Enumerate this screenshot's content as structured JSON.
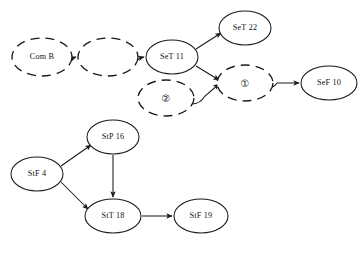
{
  "diagram": {
    "type": "directed-graph",
    "background_color": "#ffffff",
    "stroke_color": "#1a1a1a",
    "node_shape": "ellipse",
    "line_styles": {
      "solid": "solid",
      "dashed": "dashed"
    },
    "caption": "",
    "nodes": [
      {
        "id": "com-b",
        "label": "Com B",
        "style": "dashed",
        "cx": 42,
        "cy": 57,
        "rx": 30,
        "ry": 19,
        "label_kind": "text"
      },
      {
        "id": "blank-1",
        "label": "",
        "style": "dashed",
        "cx": 108,
        "cy": 57,
        "rx": 30,
        "ry": 19,
        "label_kind": "text"
      },
      {
        "id": "set-11",
        "label": "SeT 11",
        "style": "solid",
        "cx": 172,
        "cy": 57,
        "rx": 26,
        "ry": 17,
        "label_kind": "text"
      },
      {
        "id": "set-22",
        "label": "SeT 22",
        "style": "solid",
        "cx": 245,
        "cy": 28,
        "rx": 26,
        "ry": 17,
        "label_kind": "text"
      },
      {
        "id": "circle-1",
        "label": "①",
        "style": "dashed",
        "cx": 245,
        "cy": 83,
        "rx": 28,
        "ry": 18,
        "label_kind": "circled-number"
      },
      {
        "id": "circle-2",
        "label": "②",
        "style": "dashed",
        "cx": 166,
        "cy": 98,
        "rx": 28,
        "ry": 18,
        "label_kind": "circled-number"
      },
      {
        "id": "sef-10",
        "label": "SeF 10",
        "style": "solid",
        "cx": 329,
        "cy": 83,
        "rx": 28,
        "ry": 17,
        "label_kind": "text"
      },
      {
        "id": "stp-16",
        "label": "StP 16",
        "style": "solid",
        "cx": 113,
        "cy": 137,
        "rx": 26,
        "ry": 17,
        "label_kind": "text"
      },
      {
        "id": "stf-4",
        "label": "StF 4",
        "style": "solid",
        "cx": 37,
        "cy": 174,
        "rx": 26,
        "ry": 17,
        "label_kind": "text"
      },
      {
        "id": "stt-18",
        "label": "StT 18",
        "style": "solid",
        "cx": 113,
        "cy": 216,
        "rx": 28,
        "ry": 17,
        "label_kind": "text"
      },
      {
        "id": "stf-19",
        "label": "StF 19",
        "style": "solid",
        "cx": 201,
        "cy": 216,
        "rx": 27,
        "ry": 17,
        "label_kind": "text"
      }
    ],
    "edges": [
      {
        "id": "e1",
        "from": "com-b",
        "to": "blank-1",
        "arrow": true,
        "path": "M 62 62 Q 70 62 73 58 L 76 57"
      },
      {
        "id": "e2",
        "from": "blank-1",
        "to": "set-11",
        "arrow": true,
        "path": "M 129 62 Q 137 62 140 58 L 144 57"
      },
      {
        "id": "e3",
        "from": "set-11",
        "to": "set-22",
        "arrow": true,
        "path": "M 196 49 L 221 33"
      },
      {
        "id": "e4",
        "from": "set-11",
        "to": "circle-1",
        "arrow": true,
        "path": "M 196 66 L 219 80"
      },
      {
        "id": "e5",
        "from": "circle-2",
        "to": "circle-1",
        "arrow": true,
        "path": "M 192 104 Q 200 104 205 96 L 219 84"
      },
      {
        "id": "e6",
        "from": "circle-1",
        "to": "sef-10",
        "arrow": true,
        "path": "M 266 88 Q 274 88 277 83 L 299 83"
      },
      {
        "id": "e7",
        "from": "stf-4",
        "to": "stp-16",
        "arrow": true,
        "path": "M 61 166 L 91 145"
      },
      {
        "id": "e8",
        "from": "stf-4",
        "to": "stt-18",
        "arrow": true,
        "path": "M 61 182 L 88 209"
      },
      {
        "id": "e9",
        "from": "stp-16",
        "to": "stt-18",
        "arrow": true,
        "path": "M 113 155 L 113 197"
      },
      {
        "id": "e10",
        "from": "stt-18",
        "to": "stf-19",
        "arrow": true,
        "path": "M 142 216 L 172 216"
      }
    ],
    "clusters": [
      {
        "id": "cluster-top",
        "name": "sequence-cluster",
        "members": [
          "com-b",
          "blank-1",
          "set-11",
          "set-22",
          "circle-1",
          "circle-2",
          "sef-10"
        ]
      },
      {
        "id": "cluster-bottom",
        "name": "state-cluster",
        "members": [
          "stp-16",
          "stf-4",
          "stt-18",
          "stf-19"
        ]
      }
    ]
  }
}
